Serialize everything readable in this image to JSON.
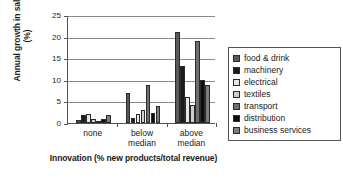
{
  "chart_data": {
    "type": "bar",
    "title": "",
    "xlabel": "Innovation (% new products/total revenue)",
    "ylabel": "Annual growth in sales (%)",
    "categories": [
      "none",
      "below median",
      "above median"
    ],
    "category_lines": [
      [
        "none"
      ],
      [
        "below",
        "median"
      ],
      [
        "above",
        "median"
      ]
    ],
    "ylim": [
      0,
      25
    ],
    "yticks": [
      0,
      5,
      10,
      15,
      20,
      25
    ],
    "grid": true,
    "legend_position": "right",
    "series": [
      {
        "name": "food & drink",
        "color": "#595959",
        "values": [
          0.8,
          7.0,
          21.0
        ]
      },
      {
        "name": "machinery",
        "color": "#1c1c1c",
        "values": [
          1.8,
          1.1,
          13.2
        ]
      },
      {
        "name": "electrical",
        "color": "#e6e6e6",
        "values": [
          2.0,
          2.0,
          6.1
        ]
      },
      {
        "name": "textiles",
        "color": "#cfcfcf",
        "values": [
          1.0,
          2.9,
          4.1
        ]
      },
      {
        "name": "transport",
        "color": "#6e6e6e",
        "values": [
          0.2,
          8.9,
          19.1
        ]
      },
      {
        "name": "distribution",
        "color": "#0d0d0d",
        "values": [
          1.0,
          2.3,
          10.0
        ]
      },
      {
        "name": "business services",
        "color": "#7d7d7d",
        "values": [
          1.9,
          4.0,
          8.9
        ]
      }
    ]
  },
  "legend": {
    "items": [
      {
        "label": "food & drink"
      },
      {
        "label": "machinery"
      },
      {
        "label": "electrical"
      },
      {
        "label": "textiles"
      },
      {
        "label": "transport"
      },
      {
        "label": "distribution"
      },
      {
        "label": "business services"
      }
    ]
  }
}
